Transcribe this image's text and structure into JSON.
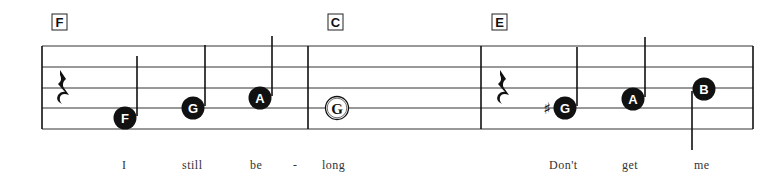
{
  "chords": [
    {
      "label": "F"
    },
    {
      "label": "C"
    },
    {
      "label": "E"
    }
  ],
  "measures": [
    {
      "chord": "F",
      "elements": [
        {
          "type": "rest",
          "kind": "quarter-rest"
        },
        {
          "type": "note",
          "pitch": "F",
          "label": "F",
          "filled": true,
          "stem": "up"
        },
        {
          "type": "note",
          "pitch": "G",
          "label": "G",
          "filled": true,
          "stem": "up"
        },
        {
          "type": "note",
          "pitch": "A",
          "label": "A",
          "filled": true,
          "stem": "up"
        }
      ]
    },
    {
      "chord": "C",
      "elements": [
        {
          "type": "note",
          "pitch": "G",
          "label": "G",
          "filled": false,
          "stem": "none"
        }
      ]
    },
    {
      "chord": "E",
      "elements": [
        {
          "type": "rest",
          "kind": "quarter-rest"
        },
        {
          "type": "note",
          "pitch": "G#",
          "label": "G",
          "accidental": "♯",
          "filled": true,
          "stem": "up"
        },
        {
          "type": "note",
          "pitch": "A",
          "label": "A",
          "filled": true,
          "stem": "up"
        },
        {
          "type": "note",
          "pitch": "B",
          "label": "B",
          "filled": true,
          "stem": "down"
        }
      ]
    }
  ],
  "lyrics": [
    "I",
    "still",
    "be",
    "-",
    "long",
    "Don't",
    "get",
    "me"
  ],
  "colors": {
    "ink": "#111111",
    "background": "#ffffff",
    "lyric": "#333333"
  }
}
